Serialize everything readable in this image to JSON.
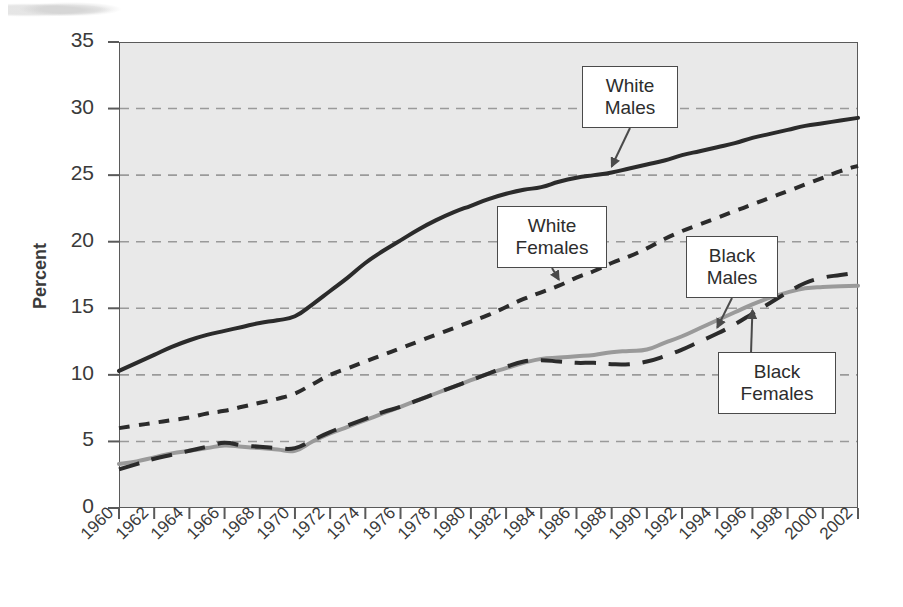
{
  "chart_data": {
    "type": "line",
    "title": "",
    "xlabel": "",
    "ylabel": "Percent",
    "xlim": [
      1960,
      2002
    ],
    "ylim": [
      0,
      35
    ],
    "grid": true,
    "legend_position": "inline-callouts",
    "x": [
      1960,
      1961,
      1962,
      1963,
      1964,
      1965,
      1966,
      1967,
      1968,
      1969,
      1970,
      1971,
      1972,
      1973,
      1974,
      1975,
      1976,
      1977,
      1978,
      1979,
      1980,
      1981,
      1982,
      1983,
      1984,
      1985,
      1986,
      1987,
      1988,
      1989,
      1990,
      1991,
      1992,
      1993,
      1994,
      1995,
      1996,
      1997,
      1998,
      1999,
      2000,
      2001,
      2002
    ],
    "x_tick_labels": [
      "1960",
      "1962",
      "1964",
      "1966",
      "1968",
      "1970",
      "1972",
      "1974",
      "1976",
      "1978",
      "1980",
      "1982",
      "1984",
      "1986",
      "1988",
      "1990",
      "1992",
      "1994",
      "1996",
      "1998",
      "2000",
      "2002"
    ],
    "y_tick_labels": [
      "0",
      "5",
      "10",
      "15",
      "20",
      "25",
      "30",
      "35"
    ],
    "y_ticks": [
      0,
      5,
      10,
      15,
      20,
      25,
      30,
      35
    ],
    "series": [
      {
        "name": "White Males",
        "style": "solid",
        "color": "#2b2b2b",
        "width": 4,
        "values": [
          10.3,
          10.9,
          11.5,
          12.1,
          12.6,
          13.0,
          13.3,
          13.6,
          13.9,
          14.1,
          14.4,
          15.3,
          16.3,
          17.3,
          18.4,
          19.3,
          20.1,
          20.9,
          21.6,
          22.2,
          22.7,
          23.2,
          23.6,
          23.9,
          24.1,
          24.5,
          24.8,
          25.0,
          25.2,
          25.5,
          25.8,
          26.1,
          26.5,
          26.8,
          27.1,
          27.4,
          27.8,
          28.1,
          28.4,
          28.7,
          28.9,
          29.1,
          29.3
        ]
      },
      {
        "name": "White Females",
        "style": "short-dash",
        "color": "#2b2b2b",
        "width": 4,
        "values": [
          6.0,
          6.2,
          6.4,
          6.6,
          6.8,
          7.1,
          7.3,
          7.6,
          7.9,
          8.2,
          8.6,
          9.3,
          10.0,
          10.5,
          11.0,
          11.5,
          12.0,
          12.5,
          13.0,
          13.5,
          14.0,
          14.5,
          15.1,
          15.7,
          16.2,
          16.7,
          17.3,
          17.8,
          18.4,
          18.9,
          19.5,
          20.2,
          20.8,
          21.3,
          21.8,
          22.3,
          22.8,
          23.3,
          23.8,
          24.3,
          24.8,
          25.3,
          25.7
        ]
      },
      {
        "name": "Black Males",
        "style": "long-dash",
        "color": "#2b2b2b",
        "width": 4,
        "values": [
          2.9,
          3.3,
          3.7,
          4.0,
          4.3,
          4.6,
          4.9,
          4.7,
          4.6,
          4.5,
          4.5,
          5.1,
          5.7,
          6.2,
          6.7,
          7.2,
          7.6,
          8.1,
          8.6,
          9.1,
          9.6,
          10.1,
          10.6,
          11.0,
          11.1,
          11.0,
          10.9,
          10.9,
          10.8,
          10.8,
          11.0,
          11.4,
          11.9,
          12.5,
          13.1,
          13.8,
          14.6,
          15.4,
          16.2,
          16.9,
          17.3,
          17.5,
          17.7
        ]
      },
      {
        "name": "Black Females",
        "style": "solid",
        "color": "#9a9a9a",
        "width": 4,
        "values": [
          3.3,
          3.5,
          3.8,
          4.1,
          4.3,
          4.5,
          4.7,
          4.6,
          4.5,
          4.4,
          4.3,
          5.0,
          5.6,
          6.1,
          6.6,
          7.1,
          7.6,
          8.1,
          8.6,
          9.1,
          9.6,
          10.1,
          10.5,
          10.9,
          11.2,
          11.3,
          11.4,
          11.5,
          11.7,
          11.8,
          11.9,
          12.4,
          12.9,
          13.5,
          14.1,
          14.7,
          15.3,
          15.8,
          16.2,
          16.5,
          16.6,
          16.65,
          16.7
        ]
      }
    ],
    "annotations": [
      {
        "id": "white-males",
        "label_line1": "White",
        "label_line2": "Males",
        "points_to_year": 1988,
        "points_to_value": 25.2,
        "arrow_direction": "down"
      },
      {
        "id": "white-females",
        "label_line1": "White",
        "label_line2": "Females",
        "points_to_year": 1985,
        "points_to_value": 16.7,
        "arrow_direction": "down"
      },
      {
        "id": "black-males",
        "label_line1": "Black",
        "label_line2": "Males",
        "points_to_year": 1994,
        "points_to_value": 13.1,
        "arrow_direction": "down"
      },
      {
        "id": "black-females",
        "label_line1": "Black",
        "label_line2": "Females",
        "points_to_year": 1996,
        "points_to_value": 15.3,
        "arrow_direction": "up"
      }
    ]
  },
  "colors": {
    "plot_background": "#e9e9e9",
    "page_background": "#ffffff",
    "axis": "#5a5a5a",
    "gridline": "#9a9a9a",
    "text": "#3a3a3a",
    "dark_series": "#2b2b2b",
    "gray_series": "#9a9a9a",
    "callout_border": "#4a4a4a",
    "callout_fill": "#ffffff"
  }
}
